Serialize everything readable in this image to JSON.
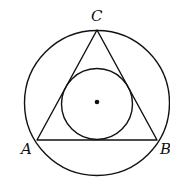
{
  "diagram": {
    "labels": {
      "A": "A",
      "B": "B",
      "C": "C"
    },
    "points": {
      "A": [
        37,
        140
      ],
      "B": [
        157,
        140
      ],
      "C": [
        97,
        30
      ],
      "center": [
        97,
        103
      ]
    },
    "outer_circle": {
      "cx": 97,
      "cy": 103,
      "r": 72
    },
    "inner_circle": {
      "cx": 97,
      "cy": 104,
      "r": 36
    },
    "stroke_color": "#111111"
  }
}
